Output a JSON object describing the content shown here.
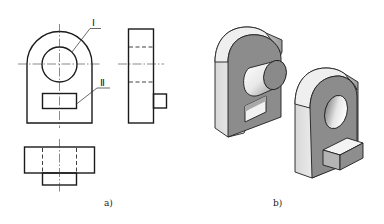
{
  "figure": {
    "panel_a": {
      "label": "a)",
      "description": "Orthographic three views",
      "callouts": [
        {
          "id": "I",
          "text": "Ⅰ",
          "target": "circular hole"
        },
        {
          "id": "II",
          "text": "Ⅱ",
          "target": "rectangular feature"
        }
      ],
      "views": [
        "front-view",
        "side-view",
        "top-view"
      ]
    },
    "panel_b": {
      "label": "b)",
      "description": "Isometric solids",
      "objects": [
        "part-with-cylinder-boss-and-rect-window",
        "part-with-round-hole-and-rect-block"
      ]
    },
    "colors": {
      "line": "#1a1a1a",
      "front_face": "#8c8c8c",
      "side_face_light": "#f4f4f4",
      "side_face_dark": "#9a9a9a",
      "background": "#ffffff"
    }
  }
}
